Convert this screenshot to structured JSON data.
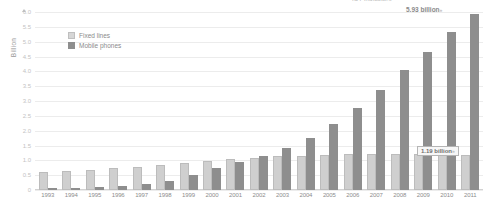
{
  "top_note": "ICT indicators",
  "axis": {
    "y_title": "Billion",
    "y_ticks": [
      "6.0",
      "5.5",
      "5.0",
      "4.5",
      "4.0",
      "3.5",
      "3.0",
      "2.5",
      "2.0",
      "1.5",
      "1.0",
      "0.5",
      "0"
    ]
  },
  "legend": {
    "items": [
      {
        "label": "Fixed lines",
        "color": "#d6d6d6"
      },
      {
        "label": "Mobile phones",
        "color": "#8e8e8e"
      }
    ]
  },
  "callouts": {
    "mobile_2011": "5.93 billion",
    "mobile_2011_mark": "»",
    "fixed_2011": "1.19 billion",
    "fixed_2011_mark": "»"
  },
  "chart_data": {
    "type": "bar",
    "title": "",
    "xlabel": "",
    "ylabel": "Billion",
    "ylim": [
      0,
      6.0
    ],
    "ytick_step": 0.5,
    "grid": true,
    "legend_position": "top-left",
    "categories": [
      "1993",
      "1994",
      "1995",
      "1996",
      "1997",
      "1998",
      "1999",
      "2000",
      "2001",
      "2002",
      "2003",
      "2004",
      "2005",
      "2006",
      "2007",
      "2008",
      "2009",
      "2010",
      "2011"
    ],
    "series": [
      {
        "name": "Fixed lines",
        "color": "#d6d6d6",
        "values": [
          0.6,
          0.65,
          0.69,
          0.74,
          0.79,
          0.84,
          0.91,
          0.98,
          1.05,
          1.08,
          1.13,
          1.16,
          1.19,
          1.22,
          1.22,
          1.22,
          1.2,
          1.19,
          1.19
        ]
      },
      {
        "name": "Mobile phones",
        "color": "#8e8e8e",
        "values": [
          0.03,
          0.06,
          0.09,
          0.14,
          0.21,
          0.32,
          0.49,
          0.74,
          0.96,
          1.16,
          1.42,
          1.77,
          2.21,
          2.75,
          3.37,
          4.03,
          4.64,
          5.32,
          5.93
        ]
      }
    ],
    "annotations": [
      {
        "series": "Mobile phones",
        "category": "2011",
        "text": "5.93 billion"
      },
      {
        "series": "Fixed lines",
        "category": "2011",
        "text": "1.19 billion"
      }
    ]
  }
}
